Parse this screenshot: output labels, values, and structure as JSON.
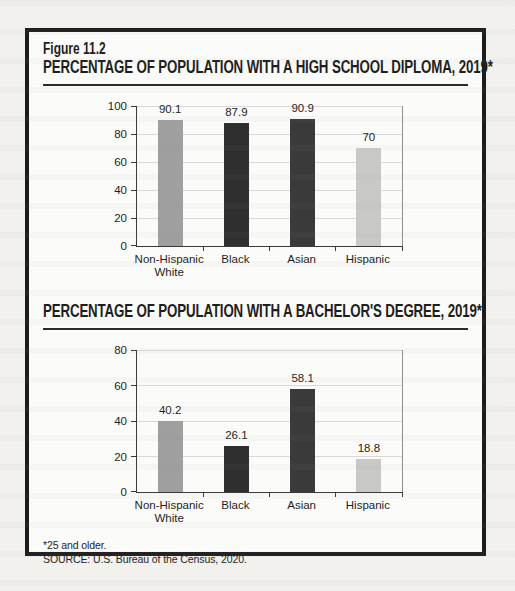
{
  "page": {
    "figure_label": "Figure 11.2",
    "footnote": "*25 and older.",
    "source": "SOURCE: U.S. Bureau of the Census, 2020."
  },
  "colors": {
    "box_border": "#1c1c1c",
    "page_background": "#f2f1ee",
    "box_background": "#fbfbf9",
    "axis": "#3a3a3a",
    "gridline": "#d8d8d6",
    "bar_gray": "#9f9f9f",
    "bar_black": "#2f2f2f",
    "bar_darkgray": "#3a3a3a",
    "bar_lightgray": "#c9c9c7"
  },
  "chart_data": [
    {
      "type": "bar",
      "title": "PERCENTAGE OF POPULATION WITH A HIGH SCHOOL DIPLOMA, 2019*",
      "categories": [
        "Non-Hispanic\nWhite",
        "Black",
        "Asian",
        "Hispanic"
      ],
      "values": [
        90.1,
        87.9,
        90.9,
        70
      ],
      "value_labels": [
        "90.1",
        "87.9",
        "90.9",
        "70"
      ],
      "bar_colors": [
        "#9f9f9f",
        "#2f2f2f",
        "#3a3a3a",
        "#c9c9c7"
      ],
      "xlabel": "",
      "ylabel": "",
      "ylim": [
        0,
        100
      ],
      "yticks": [
        0,
        20,
        40,
        60,
        80,
        100
      ],
      "grid": true,
      "legend": "none"
    },
    {
      "type": "bar",
      "title": "PERCENTAGE OF POPULATION WITH A BACHELOR'S DEGREE, 2019*",
      "categories": [
        "Non-Hispanic\nWhite",
        "Black",
        "Asian",
        "Hispanic"
      ],
      "values": [
        40.2,
        26.1,
        58.1,
        18.8
      ],
      "value_labels": [
        "40.2",
        "26.1",
        "58.1",
        "18.8"
      ],
      "bar_colors": [
        "#9f9f9f",
        "#2f2f2f",
        "#3a3a3a",
        "#c9c9c7"
      ],
      "xlabel": "",
      "ylabel": "",
      "ylim": [
        0,
        80
      ],
      "yticks": [
        0,
        20,
        40,
        60,
        80
      ],
      "grid": true,
      "legend": "none"
    }
  ]
}
